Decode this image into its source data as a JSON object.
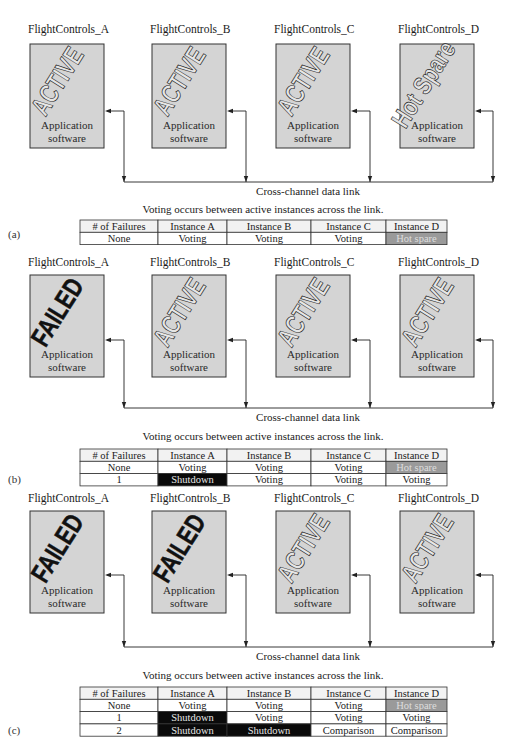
{
  "panels": [
    {
      "tag": "(a)",
      "channels": [
        {
          "name": "FlightControls_A",
          "status": "ACTIVE",
          "status_style": "outline",
          "software": [
            "Application",
            "software"
          ]
        },
        {
          "name": "FlightControls_B",
          "status": "ACTIVE",
          "status_style": "outline",
          "software": [
            "Application",
            "software"
          ]
        },
        {
          "name": "FlightControls_C",
          "status": "ACTIVE",
          "status_style": "outline",
          "software": [
            "Application",
            "software"
          ]
        },
        {
          "name": "FlightControls_D",
          "status": "Hot Spare",
          "status_style": "outline",
          "software": [
            "Application",
            "software"
          ]
        }
      ],
      "link_label": "Cross-channel data link",
      "caption": "Voting occurs between active instances across the link.",
      "table": {
        "headers": [
          "# of Failures",
          "Instance A",
          "Instance B",
          "Instance C",
          "Instance D"
        ],
        "rows": [
          [
            {
              "text": "None",
              "state": "normal"
            },
            {
              "text": "Voting",
              "state": "normal"
            },
            {
              "text": "Voting",
              "state": "normal"
            },
            {
              "text": "Voting",
              "state": "normal"
            },
            {
              "text": "Hot spare",
              "state": "spare"
            }
          ]
        ]
      }
    },
    {
      "tag": "(b)",
      "channels": [
        {
          "name": "FlightControls_A",
          "status": "FAILED",
          "status_style": "solid",
          "software": [
            "Application",
            "software"
          ]
        },
        {
          "name": "FlightControls_B",
          "status": "ACTIVE",
          "status_style": "outline",
          "software": [
            "Application",
            "software"
          ]
        },
        {
          "name": "FlightControls_C",
          "status": "ACTIVE",
          "status_style": "outline",
          "software": [
            "Application",
            "software"
          ]
        },
        {
          "name": "FlightControls_D",
          "status": "ACTIVE",
          "status_style": "outline",
          "software": [
            "Application",
            "software"
          ]
        }
      ],
      "link_label": "Cross-channel data link",
      "caption": "Voting occurs between active instances across the link.",
      "table": {
        "headers": [
          "# of Failures",
          "Instance A",
          "Instance B",
          "Instance C",
          "Instance D"
        ],
        "rows": [
          [
            {
              "text": "None",
              "state": "normal"
            },
            {
              "text": "Voting",
              "state": "normal"
            },
            {
              "text": "Voting",
              "state": "normal"
            },
            {
              "text": "Voting",
              "state": "normal"
            },
            {
              "text": "Hot spare",
              "state": "spare"
            }
          ],
          [
            {
              "text": "1",
              "state": "normal"
            },
            {
              "text": "Shutdown",
              "state": "shutdown"
            },
            {
              "text": "Voting",
              "state": "normal"
            },
            {
              "text": "Voting",
              "state": "normal"
            },
            {
              "text": "Voting",
              "state": "normal"
            }
          ]
        ]
      }
    },
    {
      "tag": "(c)",
      "channels": [
        {
          "name": "FlightControls_A",
          "status": "FAILED",
          "status_style": "solid",
          "software": [
            "Application",
            "software"
          ]
        },
        {
          "name": "FlightControls_B",
          "status": "FAILED",
          "status_style": "solid",
          "software": [
            "Application",
            "software"
          ]
        },
        {
          "name": "FlightControls_C",
          "status": "ACTIVE",
          "status_style": "outline",
          "software": [
            "Application",
            "software"
          ]
        },
        {
          "name": "FlightControls_D",
          "status": "ACTIVE",
          "status_style": "outline",
          "software": [
            "Application",
            "software"
          ]
        }
      ],
      "link_label": "Cross-channel data link",
      "caption": "Voting occurs between active instances across the link.",
      "table": {
        "headers": [
          "# of Failures",
          "Instance A",
          "Instance B",
          "Instance C",
          "Instance D"
        ],
        "rows": [
          [
            {
              "text": "None",
              "state": "normal"
            },
            {
              "text": "Voting",
              "state": "normal"
            },
            {
              "text": "Voting",
              "state": "normal"
            },
            {
              "text": "Voting",
              "state": "normal"
            },
            {
              "text": "Hot spare",
              "state": "spare"
            }
          ],
          [
            {
              "text": "1",
              "state": "normal"
            },
            {
              "text": "Shutdown",
              "state": "shutdown"
            },
            {
              "text": "Voting",
              "state": "normal"
            },
            {
              "text": "Voting",
              "state": "normal"
            },
            {
              "text": "Voting",
              "state": "normal"
            }
          ],
          [
            {
              "text": "2",
              "state": "normal"
            },
            {
              "text": "Shutdown",
              "state": "shutdown"
            },
            {
              "text": "Shutdown",
              "state": "shutdown"
            },
            {
              "text": "Comparison",
              "state": "normal"
            },
            {
              "text": "Comparison",
              "state": "normal"
            }
          ]
        ]
      }
    }
  ]
}
